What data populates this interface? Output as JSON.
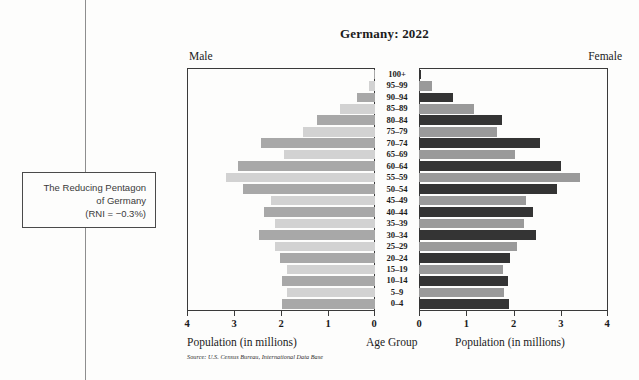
{
  "annotation": {
    "line1": "The Reducing Pentagon",
    "line2": "of Germany",
    "line3": "(RNI = −0.3%)"
  },
  "header": {
    "title": "Germany: 2022",
    "male_label": "Male",
    "female_label": "Female"
  },
  "axis": {
    "left_caption": "Population (in millions)",
    "center_caption": "Age Group",
    "right_caption": "Population (in millions)",
    "left_ticks": [
      "4",
      "3",
      "2",
      "1",
      "0"
    ],
    "right_ticks": [
      "0",
      "1",
      "2",
      "3",
      "4"
    ]
  },
  "source": "Source: U.S. Census Bureau, International Data Base",
  "colors": {
    "male_light": "#d2d2d2",
    "male_dark": "#a8a8a8",
    "female_light": "#9a9a9a",
    "female_dark": "#343434",
    "frame": "#3a3a3a",
    "connector": "#8e8e8e"
  },
  "chart_data": {
    "type": "bar",
    "subtype": "population-pyramid",
    "title": "Germany: 2022",
    "xlabel": "Population (in millions)",
    "ylabel": "Age Group",
    "xlim": [
      0,
      4
    ],
    "grid": false,
    "legend": "none",
    "categories": [
      "100+",
      "95–99",
      "90–94",
      "85–89",
      "80–84",
      "75–79",
      "70–74",
      "65–69",
      "60–64",
      "55–59",
      "50–54",
      "45–49",
      "40–44",
      "35–39",
      "30–34",
      "25–29",
      "20–24",
      "15–19",
      "10–14",
      "5–9",
      "0–4"
    ],
    "series": [
      {
        "name": "Male",
        "side": "left",
        "values": [
          0.02,
          0.12,
          0.38,
          0.75,
          1.25,
          1.55,
          2.45,
          1.95,
          2.95,
          3.2,
          2.85,
          2.25,
          2.4,
          2.15,
          2.5,
          2.15,
          2.05,
          1.9,
          2.0,
          1.9,
          2.0
        ]
      },
      {
        "name": "Female",
        "side": "right",
        "values": [
          0.05,
          0.28,
          0.72,
          1.18,
          1.78,
          1.68,
          2.6,
          2.05,
          3.05,
          3.45,
          2.95,
          2.3,
          2.45,
          2.25,
          2.5,
          2.1,
          1.95,
          1.8,
          1.9,
          1.82,
          1.93
        ]
      }
    ]
  }
}
